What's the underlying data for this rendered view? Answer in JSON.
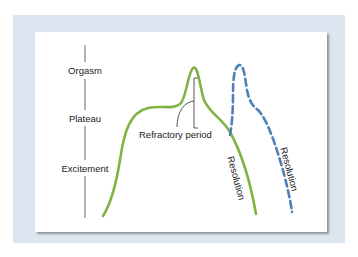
{
  "diagram": {
    "type": "sexual-response-cycle",
    "axis": {
      "labels": [
        "Orgasm",
        "Plateau",
        "Excitement"
      ]
    },
    "annotations": {
      "refractory_period": "Refractory period",
      "resolution_solid": "Resolution",
      "resolution_dashed": "Resolution"
    },
    "curves": [
      {
        "name": "male-response",
        "style": "solid",
        "color": "#7fb342"
      },
      {
        "name": "second-response",
        "style": "dashed",
        "color": "#4f7fb8"
      }
    ],
    "colors": {
      "frame": "#dbe6f0",
      "card": "#ffffff",
      "axis_line": "#555555",
      "text": "#222222"
    }
  }
}
